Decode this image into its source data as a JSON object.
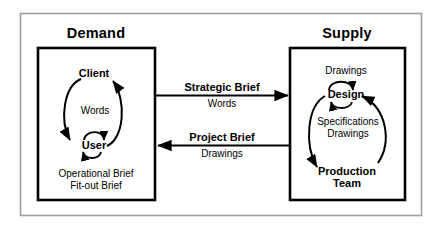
{
  "diagram": {
    "type": "process-cycle-diagram",
    "background_color": "#ffffff",
    "line_color": "#000000",
    "outer_frame": {
      "name": "outer-border",
      "stroke": "#9a9a9a"
    },
    "sides": [
      {
        "id": "demand",
        "title": "Demand",
        "nodes": [
          {
            "id": "client",
            "label": "Client",
            "bold": true
          },
          {
            "id": "user",
            "label": "User",
            "bold": true
          }
        ],
        "cycle_label": "Words",
        "self_loop": {
          "on": "user",
          "label": ""
        },
        "footnotes": [
          "Operational Brief",
          "Fit-out Brief"
        ]
      },
      {
        "id": "supply",
        "title": "Supply",
        "nodes": [
          {
            "id": "design",
            "label": "Design",
            "bold": true
          },
          {
            "id": "production-team",
            "label": "Production\nTeam",
            "bold": true
          }
        ],
        "cycle_label": "Specifications\nDrawings",
        "self_loop": {
          "on": "design",
          "label": "Drawings"
        },
        "footnotes": []
      }
    ],
    "connectors": [
      {
        "id": "strategic-brief",
        "title": "Strategic Brief",
        "subtitle": "Words",
        "direction": "right",
        "from": "demand",
        "to": "supply"
      },
      {
        "id": "project-brief",
        "title": "Project Brief",
        "subtitle": "Drawings",
        "direction": "left",
        "from": "supply",
        "to": "demand"
      }
    ]
  },
  "text": {
    "demand_title": "Demand",
    "supply_title": "Supply",
    "client": "Client",
    "user": "User",
    "words": "Words",
    "operational_brief": "Operational Brief",
    "fitout_brief": "Fit-out Brief",
    "drawings_top": "Drawings",
    "design": "Design",
    "specifications": "Specifications",
    "drawings_mid": "Drawings",
    "production": "Production",
    "team": "Team",
    "strategic_brief": "Strategic Brief",
    "strategic_brief_sub": "Words",
    "project_brief": "Project Brief",
    "project_brief_sub": "Drawings"
  }
}
